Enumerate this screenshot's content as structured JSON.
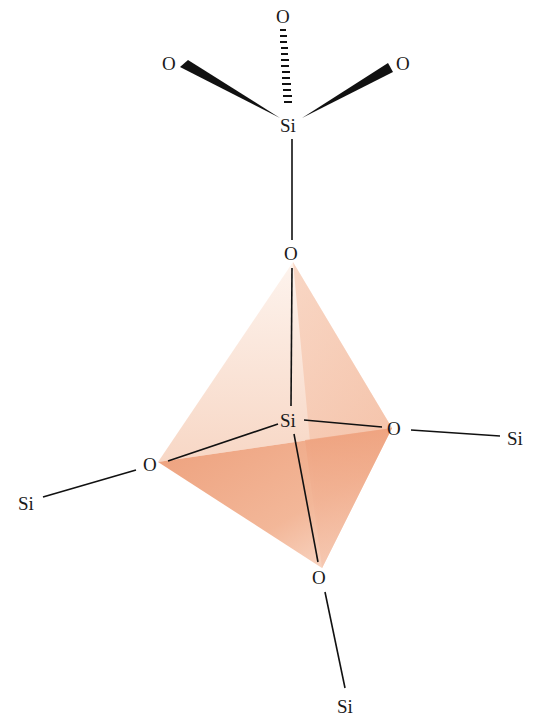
{
  "colors": {
    "face_dark": "#ec9f7c",
    "face_mid": "#f3bda2",
    "face_light": "#fae0d2",
    "bond": "#111111",
    "text": "#1a1a1a"
  },
  "atoms": {
    "o_top": "O",
    "o_upper_left": "O",
    "o_upper_right": "O",
    "si_top": "Si",
    "o_bridge": "O",
    "si_center": "Si",
    "o_right": "O",
    "si_right": "Si",
    "o_left": "O",
    "si_left": "Si",
    "o_bottom": "O",
    "si_bottom": "Si"
  },
  "bonds": [
    {
      "from": "si_top",
      "to": "o_top",
      "style": "hashed-wedge"
    },
    {
      "from": "si_top",
      "to": "o_upper_left",
      "style": "solid-wedge"
    },
    {
      "from": "si_top",
      "to": "o_upper_right",
      "style": "solid-wedge"
    },
    {
      "from": "si_top",
      "to": "o_bridge",
      "style": "line"
    },
    {
      "from": "o_bridge",
      "to": "si_center",
      "style": "line"
    },
    {
      "from": "si_center",
      "to": "o_right",
      "style": "line"
    },
    {
      "from": "si_center",
      "to": "o_left",
      "style": "line"
    },
    {
      "from": "si_center",
      "to": "o_bottom",
      "style": "line"
    },
    {
      "from": "o_right",
      "to": "si_right",
      "style": "line"
    },
    {
      "from": "o_left",
      "to": "si_left",
      "style": "line"
    },
    {
      "from": "o_bottom",
      "to": "si_bottom",
      "style": "line"
    }
  ]
}
